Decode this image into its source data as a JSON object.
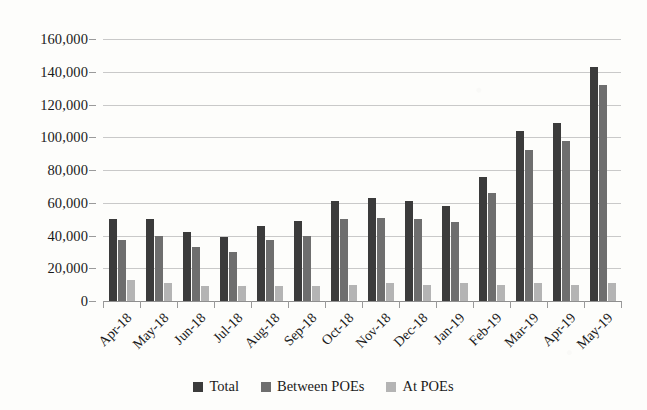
{
  "chart_data": {
    "type": "bar",
    "title": "",
    "subtitle": "",
    "xlabel": "",
    "ylabel": "",
    "ylim": [
      0,
      160000
    ],
    "ytick_step": 20000,
    "ytick_labels": [
      "160,000",
      "140,000",
      "120,000",
      "100,000",
      "80,000",
      "60,000",
      "40,000",
      "20,000",
      "0"
    ],
    "ytick_values": [
      160000,
      140000,
      120000,
      100000,
      80000,
      60000,
      40000,
      20000,
      0
    ],
    "grid": true,
    "legend_position": "bottom",
    "categories": [
      "Apr-18",
      "May-18",
      "Jun-18",
      "Jul-18",
      "Aug-18",
      "Sep-18",
      "Oct-18",
      "Nov-18",
      "Dec-18",
      "Jan-19",
      "Feb-19",
      "Mar-19",
      "Apr-19",
      "May-19"
    ],
    "series": [
      {
        "name": "Total",
        "color": "#3b3b3b",
        "values": [
          50000,
          50000,
          42000,
          39000,
          46000,
          49000,
          61000,
          63000,
          61000,
          58000,
          76000,
          104000,
          109000,
          143000
        ]
      },
      {
        "name": "Between POEs",
        "color": "#6e6e6e",
        "values": [
          37000,
          40000,
          33000,
          30000,
          37000,
          40000,
          50000,
          51000,
          50000,
          48000,
          66000,
          92000,
          98000,
          132000
        ]
      },
      {
        "name": "At POEs",
        "color": "#b4b4b4",
        "values": [
          13000,
          11000,
          9000,
          9000,
          9000,
          9000,
          10000,
          11000,
          10000,
          11000,
          10000,
          11000,
          10000,
          11000
        ]
      }
    ]
  }
}
